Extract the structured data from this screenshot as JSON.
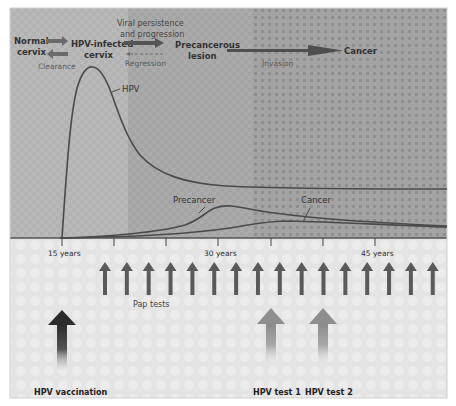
{
  "header": {
    "stages": [
      {
        "id": "normal",
        "label_line1": "Normal",
        "label_line2": "cervix"
      },
      {
        "id": "infected",
        "label_line1": "HPV-infected",
        "label_line2": "cervix"
      },
      {
        "id": "precancer",
        "label_line1": "Precancerous",
        "label_line2": "lesion"
      },
      {
        "id": "cancer",
        "label_line1": "Cancer",
        "label_line2": ""
      }
    ],
    "transitions": {
      "clearance": "Clearance",
      "progression_line1": "Viral persistence",
      "progression_line2": "and progression",
      "regression": "Regression",
      "invasion": "Invasion"
    }
  },
  "chart_data": {
    "type": "line",
    "xlabel": "Age",
    "ylabel": "",
    "x_ticks": [
      "15 years",
      "",
      "",
      "30 years",
      "",
      "",
      "45 years"
    ],
    "x_tick_values": [
      15,
      20,
      25,
      30,
      35,
      40,
      45
    ],
    "xlim": [
      10,
      52
    ],
    "ylim": [
      0,
      1
    ],
    "grid": false,
    "legend": "inline labels",
    "series": [
      {
        "name": "HPV",
        "x": [
          15,
          16,
          17,
          18,
          20,
          22,
          25,
          28,
          32,
          38,
          45,
          52
        ],
        "values": [
          0.0,
          0.6,
          0.85,
          0.88,
          0.75,
          0.5,
          0.33,
          0.25,
          0.2,
          0.17,
          0.16,
          0.16
        ]
      },
      {
        "name": "Precancer",
        "x": [
          15,
          20,
          24,
          27,
          29,
          31,
          35,
          40,
          45,
          52
        ],
        "values": [
          0.0,
          0.01,
          0.04,
          0.08,
          0.11,
          0.12,
          0.1,
          0.08,
          0.06,
          0.05
        ]
      },
      {
        "name": "Cancer",
        "x": [
          15,
          25,
          30,
          34,
          37,
          42,
          47,
          52
        ],
        "values": [
          0.0,
          0.01,
          0.03,
          0.06,
          0.07,
          0.066,
          0.06,
          0.055
        ]
      }
    ],
    "annotations": [
      "HPV",
      "Precancer",
      "Cancer"
    ]
  },
  "interventions": {
    "pap_tests_label": "Pap tests",
    "pap_test_count": 16,
    "vaccination_label": "HPV vaccination",
    "hpv_test_1_label": "HPV test 1",
    "hpv_test_2_label": "HPV test 2"
  },
  "colors": {
    "zone1": "#b8b8b8",
    "zone2": "#a9a9a9",
    "zone3": "#9c9c9c",
    "curve": "#4a4a4a",
    "arrow_dark": "#2f2f2f",
    "pap_arrow": "#5a5a5a",
    "hpv_test_arrow": "#8f8f8f",
    "bottom_panel": "#e6e6e6"
  }
}
